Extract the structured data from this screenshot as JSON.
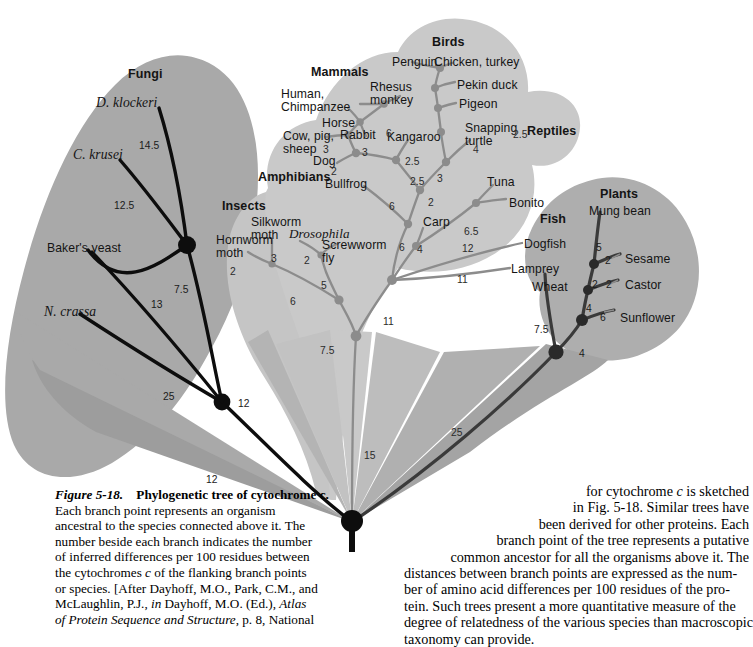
{
  "figure": {
    "number": "Figure 5-18.",
    "title": "Phylogenetic tree of cytochrome c.",
    "caption_left": "Each branch point represents an organism ancestral to the species connected above it. The number beside each branch indicates the number of inferred differences per 100 residues between the cytochromes c of the flanking branch points or species. [After Dayhoff, M.O., Park, C.M., and McLaughlin, P.J., in Dayhoff, M.O. (Ed.), Atlas of Protein Sequence and Structure, p. 8, National",
    "caption_left_lines": [
      "Each branch point represents an organism",
      "ancestral to the species connected above it. The",
      "number beside each branch indicates the number",
      "of inferred differences per 100 residues between",
      "the cytochromes c of the flanking branch points",
      "or species. [After Dayhoff, M.O., Park, C.M., and",
      "McLaughlin, P.J., in Dayhoff, M.O. (Ed.), Atlas",
      "of Protein Sequence and Structure, p. 8, National"
    ],
    "caption_right_lines": [
      "for cytochrome c is sketched",
      "in Fig. 5-18. Similar trees have",
      "been derived for other proteins. Each",
      "branch point of the tree represents a putative",
      "common ancestor for all the organisms above it. The",
      "distances between branch points are expressed as the num-",
      "ber of amino acid differences per 100 residues of the pro-",
      "tein. Such trees present a more quantitative measure of the",
      "degree of relatedness of the various species than macroscopic",
      "taxonomy can provide."
    ]
  },
  "colors": {
    "fungi_blob": "#a9a9a9",
    "animals_blob": "#c9c9c9",
    "plants_blob": "#aeaeae",
    "trunk_wedge_dark": "#9d9d9d",
    "trunk_wedge_mid": "#b4b4b4",
    "branch_dark": "#0d0d0d",
    "branch_light": "#8c8c8c",
    "branch_plant": "#4a4a4a",
    "page_bg": "#ffffff",
    "text": "#141414"
  },
  "groups": [
    {
      "id": "fungi",
      "label": "Fungi",
      "x": 128,
      "y": 68
    },
    {
      "id": "mammals",
      "label": "Mammals",
      "x": 311,
      "y": 66
    },
    {
      "id": "birds",
      "label": "Birds",
      "x": 432,
      "y": 36
    },
    {
      "id": "reptiles",
      "label": "Reptiles",
      "x": 527,
      "y": 125
    },
    {
      "id": "amphibians",
      "label": "Amphibians",
      "x": 258,
      "y": 171
    },
    {
      "id": "insects",
      "label": "Insects",
      "x": 222,
      "y": 200
    },
    {
      "id": "fish",
      "label": "Fish",
      "x": 540,
      "y": 213
    },
    {
      "id": "plants",
      "label": "Plants",
      "x": 600,
      "y": 188
    }
  ],
  "species": [
    {
      "id": "d-klockeri",
      "label": "D. klockeri",
      "x": 96,
      "y": 96,
      "style": "serif-it"
    },
    {
      "id": "c-krusei",
      "label": "C. krusei",
      "x": 73,
      "y": 148,
      "style": "serif-it"
    },
    {
      "id": "bakers-yeast",
      "label": "Baker's yeast",
      "x": 47,
      "y": 242,
      "style": "plain"
    },
    {
      "id": "n-crassa",
      "label": "N. crassa",
      "x": 44,
      "y": 305,
      "style": "serif-it"
    },
    {
      "id": "hornworm-moth",
      "label": "Hornworm\nmoth",
      "x": 216,
      "y": 234,
      "style": "plain"
    },
    {
      "id": "silkworm-moth",
      "label": "Silkworm\nmoth",
      "x": 251,
      "y": 216,
      "style": "plain"
    },
    {
      "id": "drosophila",
      "label": "Drosophila",
      "x": 289,
      "y": 227,
      "style": "italic"
    },
    {
      "id": "screwworm-fly",
      "label": "Screwworm\nfly",
      "x": 322,
      "y": 239,
      "style": "plain"
    },
    {
      "id": "human-chimp",
      "label": "Human,\nChimpanzee",
      "x": 281,
      "y": 88,
      "style": "plain"
    },
    {
      "id": "rhesus-monkey",
      "label": "Rhesus\nmonkey",
      "x": 370,
      "y": 81,
      "style": "plain"
    },
    {
      "id": "horse",
      "label": "Horse",
      "x": 322,
      "y": 117,
      "style": "plain"
    },
    {
      "id": "rabbit",
      "label": "Rabbit",
      "x": 340,
      "y": 129,
      "style": "plain"
    },
    {
      "id": "cow-pig-sheep",
      "label": "Cow, pig,\nsheep",
      "x": 283,
      "y": 130,
      "style": "plain"
    },
    {
      "id": "dog",
      "label": "Dog",
      "x": 313,
      "y": 155,
      "style": "plain"
    },
    {
      "id": "kangaroo",
      "label": "Kangaroo",
      "x": 387,
      "y": 131,
      "style": "plain"
    },
    {
      "id": "bullfrog",
      "label": "Bullfrog",
      "x": 325,
      "y": 178,
      "style": "plain"
    },
    {
      "id": "penguin",
      "label": "Penguin",
      "x": 392,
      "y": 56,
      "style": "plain"
    },
    {
      "id": "chicken-turkey",
      "label": "Chicken, turkey",
      "x": 434,
      "y": 56,
      "style": "plain"
    },
    {
      "id": "pekin-duck",
      "label": "Pekin duck",
      "x": 457,
      "y": 79,
      "style": "plain"
    },
    {
      "id": "pigeon",
      "label": "Pigeon",
      "x": 459,
      "y": 98,
      "style": "plain"
    },
    {
      "id": "snapping-turtle",
      "label": "Snapping\nturtle",
      "x": 465,
      "y": 122,
      "style": "plain"
    },
    {
      "id": "tuna",
      "label": "Tuna",
      "x": 487,
      "y": 176,
      "style": "plain"
    },
    {
      "id": "bonito",
      "label": "Bonito",
      "x": 509,
      "y": 197,
      "style": "plain"
    },
    {
      "id": "carp",
      "label": "Carp",
      "x": 423,
      "y": 216,
      "style": "plain"
    },
    {
      "id": "dogfish",
      "label": "Dogfish",
      "x": 524,
      "y": 238,
      "style": "plain"
    },
    {
      "id": "lamprey",
      "label": "Lamprey",
      "x": 511,
      "y": 263,
      "style": "plain"
    },
    {
      "id": "wheat",
      "label": "Wheat",
      "x": 532,
      "y": 281,
      "style": "plain"
    },
    {
      "id": "mung-bean",
      "label": "Mung bean",
      "x": 589,
      "y": 205,
      "style": "plain"
    },
    {
      "id": "sesame",
      "label": "Sesame",
      "x": 625,
      "y": 253,
      "style": "plain"
    },
    {
      "id": "castor",
      "label": "Castor",
      "x": 625,
      "y": 279,
      "style": "plain"
    },
    {
      "id": "sunflower",
      "label": "Sunflower",
      "x": 620,
      "y": 312,
      "style": "plain"
    }
  ],
  "branch_numbers": [
    {
      "id": "n-14-5",
      "value": "14.5",
      "x": 139,
      "y": 140,
      "tone": "dark"
    },
    {
      "id": "n-12-5",
      "value": "12.5",
      "x": 114,
      "y": 200,
      "tone": "dark"
    },
    {
      "id": "n-7-5-a",
      "value": "7.5",
      "x": 174,
      "y": 284,
      "tone": "dark"
    },
    {
      "id": "n-13",
      "value": "13",
      "x": 151,
      "y": 299,
      "tone": "dark"
    },
    {
      "id": "n-25-l",
      "value": "25",
      "x": 163,
      "y": 391,
      "tone": "dark"
    },
    {
      "id": "n-12-l",
      "value": "12",
      "x": 238,
      "y": 398,
      "tone": "dark"
    },
    {
      "id": "n-12-l2",
      "value": "12",
      "x": 206,
      "y": 474,
      "tone": "dark"
    },
    {
      "id": "n-2-hw",
      "value": "2",
      "x": 230,
      "y": 266
    },
    {
      "id": "n-3-sw",
      "value": "3",
      "x": 271,
      "y": 253
    },
    {
      "id": "n-2-dr",
      "value": "2",
      "x": 304,
      "y": 255
    },
    {
      "id": "n-6-ins",
      "value": "6",
      "x": 290,
      "y": 296
    },
    {
      "id": "n-5-ins",
      "value": "5",
      "x": 321,
      "y": 280
    },
    {
      "id": "n-7-5-in",
      "value": "7.5",
      "x": 320,
      "y": 345
    },
    {
      "id": "n-11-ins",
      "value": "11",
      "x": 383,
      "y": 316
    },
    {
      "id": "n-3-cp",
      "value": "3",
      "x": 323,
      "y": 144
    },
    {
      "id": "n-6-rab",
      "value": "6",
      "x": 386,
      "y": 128
    },
    {
      "id": "n-3-mam",
      "value": "3",
      "x": 362,
      "y": 147
    },
    {
      "id": "n-2-dog",
      "value": "2",
      "x": 331,
      "y": 166
    },
    {
      "id": "n-2-5-kan",
      "value": "2.5",
      "x": 405,
      "y": 156
    },
    {
      "id": "n-2-5-b",
      "value": "2.5",
      "x": 410,
      "y": 176
    },
    {
      "id": "n-3-bird",
      "value": "3",
      "x": 437,
      "y": 173
    },
    {
      "id": "n-2-5-c",
      "value": "2.5",
      "x": 513,
      "y": 129
    },
    {
      "id": "n-4-turt",
      "value": "4",
      "x": 473,
      "y": 144
    },
    {
      "id": "n-6-frog",
      "value": "6",
      "x": 389,
      "y": 201
    },
    {
      "id": "n-2-carp",
      "value": "2",
      "x": 428,
      "y": 197
    },
    {
      "id": "n-6-5",
      "value": "6.5",
      "x": 464,
      "y": 226
    },
    {
      "id": "n-6-f",
      "value": "6",
      "x": 399,
      "y": 242
    },
    {
      "id": "n-4-f",
      "value": "4",
      "x": 417,
      "y": 244
    },
    {
      "id": "n-12-df",
      "value": "12",
      "x": 462,
      "y": 243
    },
    {
      "id": "n-11-lm",
      "value": "11",
      "x": 457,
      "y": 274
    },
    {
      "id": "n-15",
      "value": "15",
      "x": 364,
      "y": 450
    },
    {
      "id": "n-25-r",
      "value": "25",
      "x": 451,
      "y": 427
    },
    {
      "id": "n-5-mb",
      "value": "5",
      "x": 596,
      "y": 242,
      "tone": "dark"
    },
    {
      "id": "n-2-ses",
      "value": "2",
      "x": 605,
      "y": 255,
      "tone": "dark"
    },
    {
      "id": "n-2-wh",
      "value": "2",
      "x": 592,
      "y": 279,
      "tone": "dark"
    },
    {
      "id": "n-2-cas",
      "value": "2",
      "x": 606,
      "y": 279,
      "tone": "dark"
    },
    {
      "id": "n-4-pl",
      "value": "4",
      "x": 586,
      "y": 303,
      "tone": "dark"
    },
    {
      "id": "n-6-sun",
      "value": "6",
      "x": 600,
      "y": 312,
      "tone": "dark"
    },
    {
      "id": "n-7-5-wh",
      "value": "7.5",
      "x": 534,
      "y": 324,
      "tone": "dark"
    },
    {
      "id": "n-4-root",
      "value": "4",
      "x": 579,
      "y": 348,
      "tone": "dark"
    }
  ]
}
